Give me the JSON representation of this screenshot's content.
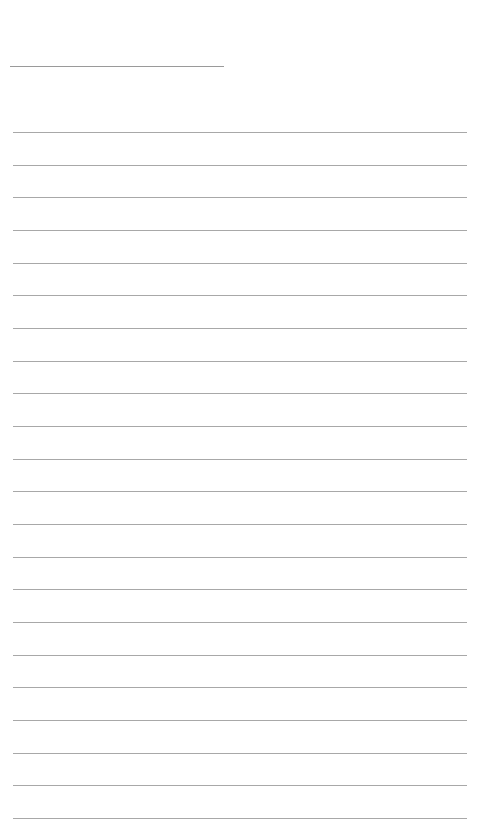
{
  "page": {
    "type": "blank ruled writing sheet",
    "header_line": {
      "x": 10,
      "y": 66,
      "width": 214
    },
    "ruled_lines": {
      "count": 22,
      "first_y": 132,
      "spacing": 32.67,
      "x": 13,
      "width": 454
    },
    "line_color": "#a8a8a8",
    "background": "#ffffff"
  }
}
